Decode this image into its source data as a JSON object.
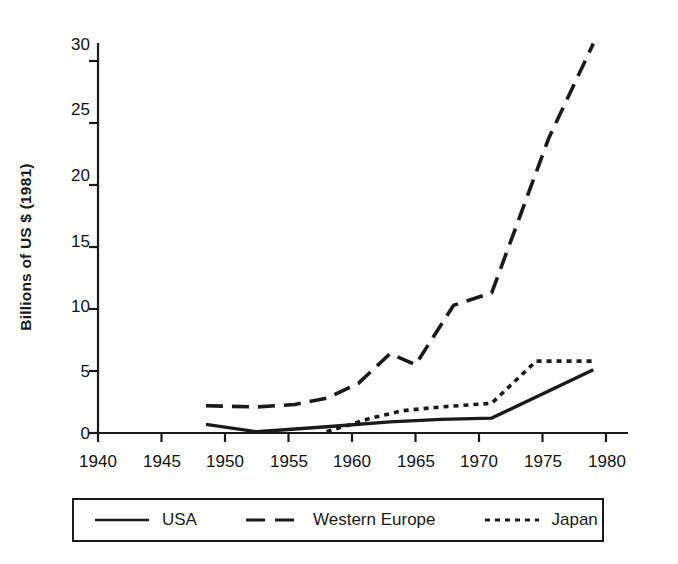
{
  "chart_data": {
    "type": "line",
    "title": "",
    "xlabel": "",
    "ylabel": "Billions of US $ (1981)",
    "xlim": [
      1940,
      1981
    ],
    "ylim": [
      0,
      31.5
    ],
    "xticks": [
      1940,
      1945,
      1950,
      1955,
      1960,
      1965,
      1970,
      1975,
      1980
    ],
    "yticks": [
      0,
      5,
      10,
      15,
      20,
      25,
      30
    ],
    "grid": false,
    "legend_position": "below-plot",
    "series": [
      {
        "name": "USA",
        "style": "solid",
        "color": "#1a1a1a",
        "points": [
          [
            1948.5,
            0.7
          ],
          [
            1952.5,
            0.1
          ],
          [
            1958.0,
            0.5
          ],
          [
            1963.0,
            0.9
          ],
          [
            1967.0,
            1.1
          ],
          [
            1971.0,
            1.2
          ],
          [
            1979.0,
            5.1
          ]
        ]
      },
      {
        "name": "Western Europe",
        "style": "dashed",
        "color": "#1a1a1a",
        "points": [
          [
            1948.5,
            2.2
          ],
          [
            1952.5,
            2.1
          ],
          [
            1955.5,
            2.3
          ],
          [
            1958.0,
            2.8
          ],
          [
            1960.5,
            4.0
          ],
          [
            1963.0,
            6.4
          ],
          [
            1965.0,
            5.5
          ],
          [
            1968.0,
            10.3
          ],
          [
            1971.0,
            11.3
          ],
          [
            1975.5,
            23.8
          ],
          [
            1979.0,
            31.4
          ]
        ]
      },
      {
        "name": "Japan",
        "style": "dotted",
        "color": "#1a1a1a",
        "points": [
          [
            1958.0,
            0.1
          ],
          [
            1961.5,
            1.2
          ],
          [
            1964.0,
            1.8
          ],
          [
            1967.0,
            2.1
          ],
          [
            1971.0,
            2.4
          ],
          [
            1974.5,
            5.8
          ],
          [
            1979.0,
            5.8
          ]
        ]
      }
    ]
  },
  "axis": {
    "y_title": "Billions of US $ (1981)",
    "y_tick_labels": [
      "30",
      "25",
      "20",
      "15",
      "10",
      "5",
      "0"
    ],
    "x_tick_labels": [
      "1940",
      "1945",
      "1950",
      "1955",
      "1960",
      "1965",
      "1970",
      "1975",
      "1980"
    ]
  },
  "legend": {
    "items": [
      {
        "label": "USA",
        "style": "solid"
      },
      {
        "label": "Western Europe",
        "style": "dashed"
      },
      {
        "label": "Japan",
        "style": "dotted"
      }
    ]
  }
}
